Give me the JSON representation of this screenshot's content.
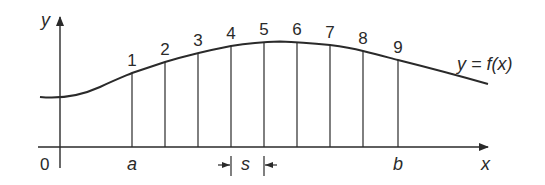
{
  "diagram": {
    "axes": {
      "x_label": "x",
      "y_label": "y",
      "origin_label": "0"
    },
    "curve_label": "y = f(x)",
    "interval": {
      "start_label": "a",
      "end_label": "b",
      "spacing_label": "s"
    },
    "ordinates": [
      {
        "label": "1",
        "x": 132,
        "y": 73
      },
      {
        "label": "2",
        "x": 165,
        "y": 62
      },
      {
        "label": "3",
        "x": 198,
        "y": 53
      },
      {
        "label": "4",
        "x": 231,
        "y": 46
      },
      {
        "label": "5",
        "x": 264,
        "y": 42
      },
      {
        "label": "6",
        "x": 297,
        "y": 42
      },
      {
        "label": "7",
        "x": 330,
        "y": 45
      },
      {
        "label": "8",
        "x": 363,
        "y": 51
      },
      {
        "label": "9",
        "x": 398,
        "y": 60
      }
    ],
    "colors": {
      "ink": "#2a2a2a",
      "background": "#ffffff"
    }
  }
}
